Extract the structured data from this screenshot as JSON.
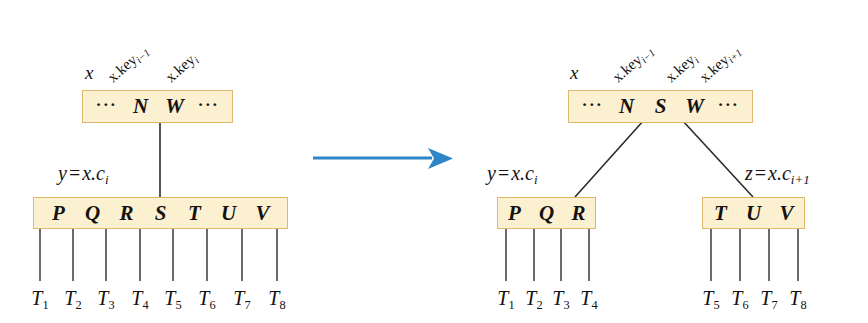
{
  "figure": {
    "colors": {
      "node_fill": "#fbf0d0",
      "node_border": "#dcb96d",
      "edge": "#2b2b2b",
      "arrow": "#2e86c8",
      "text": "#151210",
      "background": "#ffffff"
    },
    "transition_arrow": {
      "icon": "right-arrow-icon",
      "color": "#2e86c8"
    }
  },
  "before": {
    "parent": {
      "pointer_label": "x",
      "cells": [
        "···",
        "N",
        "W",
        "···"
      ],
      "key_labels": [
        {
          "base": "x.key",
          "sub": "i−1",
          "text": "x.key i−1"
        },
        {
          "base": "x.key",
          "sub": "i",
          "text": "x.key i"
        }
      ]
    },
    "child": {
      "pointer_label": {
        "text": "y = x.c i",
        "lhs": "y",
        "rhs_base": "x.c",
        "rhs_sub": "i"
      },
      "cells": [
        "P",
        "Q",
        "R",
        "S",
        "T",
        "U",
        "V"
      ],
      "subtrees": [
        "T1",
        "T2",
        "T3",
        "T4",
        "T5",
        "T6",
        "T7",
        "T8"
      ],
      "subtree_labels": [
        {
          "base": "T",
          "sub": "1"
        },
        {
          "base": "T",
          "sub": "2"
        },
        {
          "base": "T",
          "sub": "3"
        },
        {
          "base": "T",
          "sub": "4"
        },
        {
          "base": "T",
          "sub": "5"
        },
        {
          "base": "T",
          "sub": "6"
        },
        {
          "base": "T",
          "sub": "7"
        },
        {
          "base": "T",
          "sub": "8"
        }
      ]
    }
  },
  "after": {
    "parent": {
      "pointer_label": "x",
      "cells": [
        "···",
        "N",
        "S",
        "W",
        "···"
      ],
      "key_labels": [
        {
          "base": "x.key",
          "sub": "i−1",
          "text": "x.key i−1"
        },
        {
          "base": "x.key",
          "sub": "i",
          "text": "x.key i"
        },
        {
          "base": "x.key",
          "sub": "i+1",
          "text": "x.key i+1"
        }
      ]
    },
    "left_child": {
      "pointer_label": {
        "text": "y = x.c i",
        "lhs": "y",
        "rhs_base": "x.c",
        "rhs_sub": "i"
      },
      "cells": [
        "P",
        "Q",
        "R"
      ],
      "subtree_labels": [
        {
          "base": "T",
          "sub": "1"
        },
        {
          "base": "T",
          "sub": "2"
        },
        {
          "base": "T",
          "sub": "3"
        },
        {
          "base": "T",
          "sub": "4"
        }
      ]
    },
    "right_child": {
      "pointer_label": {
        "text": "z = x.c i+1",
        "lhs": "z",
        "rhs_base": "x.c",
        "rhs_sub": "i+1"
      },
      "cells": [
        "T",
        "U",
        "V"
      ],
      "subtree_labels": [
        {
          "base": "T",
          "sub": "5"
        },
        {
          "base": "T",
          "sub": "6"
        },
        {
          "base": "T",
          "sub": "7"
        },
        {
          "base": "T",
          "sub": "8"
        }
      ]
    }
  }
}
